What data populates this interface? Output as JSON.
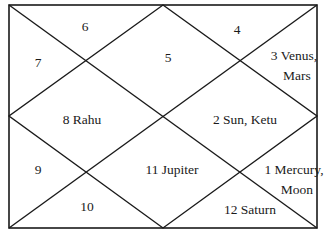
{
  "chart": {
    "style": "North Indian horoscope chart",
    "line_color": "#1a1a1a",
    "background": "#ffffff",
    "houses": [
      {
        "number": "1",
        "planets": "Mercury, Moon",
        "line1": "1 Mercury,",
        "line2": "Moon"
      },
      {
        "number": "2",
        "planets": "Sun, Ketu",
        "text": "2 Sun, Ketu"
      },
      {
        "number": "3",
        "planets": "Venus, Mars",
        "line1": "3 Venus,",
        "line2": "Mars"
      },
      {
        "number": "4",
        "planets": "",
        "text": "4"
      },
      {
        "number": "5",
        "planets": "",
        "text": "5"
      },
      {
        "number": "6",
        "planets": "",
        "text": "6"
      },
      {
        "number": "7",
        "planets": "",
        "text": "7"
      },
      {
        "number": "8",
        "planets": "Rahu",
        "text": "8 Rahu"
      },
      {
        "number": "9",
        "planets": "",
        "text": "9"
      },
      {
        "number": "10",
        "planets": "",
        "text": "10"
      },
      {
        "number": "11",
        "planets": "Jupiter",
        "text": "11 Jupiter"
      },
      {
        "number": "12",
        "planets": "Saturn",
        "text": "12 Saturn"
      }
    ]
  }
}
